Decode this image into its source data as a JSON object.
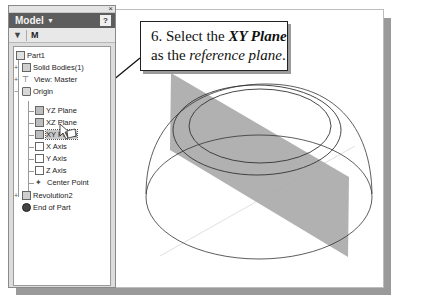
{
  "panel": {
    "title": "Model",
    "title_caret": "▼",
    "help_label": "?",
    "close_label": "×",
    "toolbar": {
      "filter_icon": "▼",
      "find_icon": "M"
    }
  },
  "tree": {
    "items": [
      {
        "label": "Part1",
        "icon": "part-icon",
        "level": 0
      },
      {
        "label": "Solid Bodies(1)",
        "icon": "solid-bodies-icon",
        "level": 1,
        "expander": "+"
      },
      {
        "label": "View: Master",
        "icon": "view-icon",
        "level": 1,
        "expander": "+"
      },
      {
        "label": "Origin",
        "icon": "folder-icon",
        "level": 1,
        "expander": "−"
      },
      {
        "label": "YZ Plane",
        "icon": "plane-icon",
        "level": 2
      },
      {
        "label": "XZ Plane",
        "icon": "plane-icon",
        "level": 2
      },
      {
        "label": "XY Plane",
        "icon": "plane-icon",
        "level": 2,
        "selected": true
      },
      {
        "label": "X Axis",
        "icon": "axis-icon",
        "level": 2
      },
      {
        "label": "Y Axis",
        "icon": "axis-icon",
        "level": 2
      },
      {
        "label": "Z Axis",
        "icon": "axis-icon",
        "level": 2
      },
      {
        "label": "Center Point",
        "icon": "center-point-icon",
        "level": 2
      },
      {
        "label": "Revolution2",
        "icon": "revolution-icon",
        "level": 1,
        "expander": "+"
      },
      {
        "label": "End of Part",
        "icon": "end-of-part-icon",
        "level": 1
      }
    ]
  },
  "callout": {
    "step": "6. Select the ",
    "emph": "XY Plane",
    "line2_prefix": "as the ",
    "line2_italic": "reference plane",
    "line2_suffix": "."
  },
  "colors": {
    "panel_header": "#5d5d5d",
    "plane_fill": "#a8a8a8",
    "frame_shadow": "#9a9a9a"
  }
}
